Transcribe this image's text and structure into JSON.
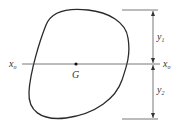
{
  "diagram": {
    "centroid_label": "G",
    "axis_left_label": "x",
    "axis_left_subscript": "o",
    "axis_right_label": "x",
    "axis_right_subscript": "o",
    "dim_upper_label": "y",
    "dim_upper_subscript": "1",
    "dim_lower_label": "y",
    "dim_lower_subscript": "2",
    "colors": {
      "stroke": "#2a2a2a",
      "line": "#555555",
      "text": "#333333"
    }
  }
}
